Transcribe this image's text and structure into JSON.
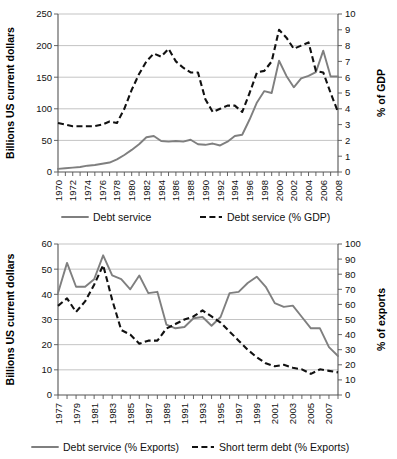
{
  "chart_data": [
    {
      "id": "debt-service-gdp",
      "type": "line",
      "title": "",
      "ylabel": "Billions US current dollars",
      "y2label": "% of GDP",
      "xlabel": "",
      "grid": true,
      "legend_position": "bottom",
      "ylim": [
        0,
        250
      ],
      "yticks": [
        0,
        50,
        100,
        150,
        200,
        250
      ],
      "y2lim": [
        0,
        10
      ],
      "y2ticks": [
        0,
        1,
        2,
        3,
        4,
        5,
        6,
        7,
        8,
        9,
        10
      ],
      "x": [
        1970,
        1971,
        1972,
        1973,
        1974,
        1975,
        1976,
        1977,
        1978,
        1979,
        1980,
        1981,
        1982,
        1983,
        1984,
        1985,
        1986,
        1987,
        1988,
        1989,
        1990,
        1991,
        1992,
        1993,
        1994,
        1995,
        1996,
        1997,
        1998,
        1999,
        2000,
        2001,
        2002,
        2003,
        2004,
        2005,
        2006,
        2007,
        2008
      ],
      "xtick_labels": [
        "1970",
        "",
        "1972",
        "",
        "1974",
        "",
        "1976",
        "",
        "1978",
        "",
        "1980",
        "",
        "1982",
        "",
        "1984",
        "",
        "1986",
        "",
        "1988",
        "",
        "1990",
        "",
        "1992",
        "",
        "1994",
        "",
        "1996",
        "",
        "1998",
        "",
        "2000",
        "",
        "2002",
        "",
        "2004",
        "",
        "2006",
        "",
        "2008"
      ],
      "series": [
        {
          "name": "Debt service",
          "axis": "left",
          "style": "solid",
          "color": "#7f7f7f",
          "values": [
            5,
            6,
            7,
            8,
            10,
            11,
            13,
            15,
            20,
            27,
            35,
            44,
            55,
            57,
            49,
            48,
            49,
            48,
            51,
            44,
            43,
            45,
            42,
            48,
            57,
            59,
            83,
            110,
            128,
            125,
            176,
            152,
            134,
            148,
            152,
            158,
            192,
            151,
            151
          ]
        },
        {
          "name": "Debt service (% GDP)",
          "axis": "right",
          "style": "dashed",
          "color": "#111111",
          "values": [
            3.1,
            3.0,
            2.9,
            2.9,
            2.9,
            2.9,
            3.0,
            3.2,
            3.1,
            4.0,
            5.2,
            6.2,
            7.0,
            7.5,
            7.3,
            7.8,
            7.0,
            6.6,
            6.3,
            6.3,
            4.6,
            3.8,
            4.0,
            4.2,
            4.2,
            3.8,
            5.0,
            6.3,
            6.4,
            7.0,
            9.0,
            8.5,
            7.8,
            8.0,
            8.2,
            6.4,
            6.3,
            5.0,
            3.8
          ]
        }
      ]
    },
    {
      "id": "debt-service-exports",
      "type": "line",
      "title": "",
      "ylabel": "Billions US current dollars",
      "y2label": "% of exports",
      "xlabel": "",
      "grid": true,
      "legend_position": "bottom",
      "ylim": [
        0,
        60
      ],
      "yticks": [
        0,
        10,
        20,
        30,
        40,
        50,
        60
      ],
      "y2lim": [
        0,
        100
      ],
      "y2ticks": [
        0,
        10,
        20,
        30,
        40,
        50,
        60,
        70,
        80,
        90,
        100
      ],
      "x": [
        1977,
        1978,
        1979,
        1980,
        1981,
        1982,
        1983,
        1984,
        1985,
        1986,
        1987,
        1988,
        1989,
        1990,
        1991,
        1992,
        1993,
        1994,
        1995,
        1996,
        1997,
        1998,
        1999,
        2000,
        2001,
        2002,
        2003,
        2004,
        2005,
        2006,
        2007,
        2008
      ],
      "xtick_labels": [
        "1977",
        "",
        "1979",
        "",
        "1981",
        "",
        "1983",
        "",
        "1985",
        "",
        "1987",
        "",
        "1989",
        "",
        "1991",
        "",
        "1993",
        "",
        "1995",
        "",
        "1997",
        "",
        "1999",
        "",
        "2001",
        "",
        "2003",
        "",
        "2005",
        "",
        "2007",
        ""
      ],
      "series": [
        {
          "name": "Debt service  (% Exports)",
          "axis": "left",
          "style": "solid",
          "color": "#7f7f7f",
          "values": [
            40.5,
            52.5,
            43.0,
            43.0,
            46.0,
            55.5,
            47.5,
            46.0,
            42.0,
            47.5,
            40.5,
            41.0,
            28.0,
            26.5,
            27.0,
            30.5,
            31.0,
            27.5,
            31.0,
            40.5,
            41.0,
            44.5,
            47.0,
            43.0,
            36.5,
            35.0,
            35.5,
            31.0,
            26.5,
            26.5,
            19.0,
            15.5
          ]
        },
        {
          "name": "Short term debt  (% Exports)",
          "axis": "right",
          "style": "dashed",
          "color": "#111111",
          "values": [
            59,
            64,
            55,
            62,
            73,
            86,
            63,
            43,
            40,
            34,
            36,
            36,
            44,
            47,
            50,
            52,
            56,
            52,
            48,
            42,
            36,
            30,
            25,
            21,
            19,
            20,
            18,
            17,
            14,
            17,
            16,
            15
          ]
        }
      ]
    }
  ]
}
